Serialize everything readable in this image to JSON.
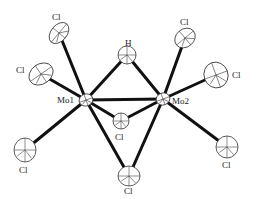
{
  "figure": {
    "type": "ORTEP molecular structure",
    "background": "#ffffff",
    "bond_color": "#111111",
    "ellipse_stroke": "#333333"
  },
  "atoms": [
    {
      "id": "Mo1",
      "label": "Mo1",
      "x": 86,
      "y": 100,
      "rx": 7,
      "ry": 6,
      "rot": -20,
      "lx": 57,
      "ly": 103
    },
    {
      "id": "Mo2",
      "label": "Mo2",
      "x": 163,
      "y": 99,
      "rx": 7,
      "ry": 6,
      "rot": -20,
      "lx": 172,
      "ly": 104
    },
    {
      "id": "H",
      "label": "H",
      "x": 127,
      "y": 55,
      "rx": 9,
      "ry": 9,
      "rot": 0,
      "lx": 125,
      "ly": 46
    },
    {
      "id": "Cl1",
      "label": "Cl",
      "x": 59,
      "y": 33,
      "rx": 12,
      "ry": 8,
      "rot": -50,
      "lx": 52,
      "ly": 20
    },
    {
      "id": "Cl2",
      "label": "Cl",
      "x": 41,
      "y": 74,
      "rx": 13,
      "ry": 10,
      "rot": -35,
      "lx": 16,
      "ly": 73
    },
    {
      "id": "Cl3",
      "label": "Cl",
      "x": 25,
      "y": 150,
      "rx": 11,
      "ry": 12,
      "rot": 0,
      "lx": 19,
      "ly": 173
    },
    {
      "id": "Cl4",
      "label": "Cl",
      "x": 121,
      "y": 121,
      "rx": 8,
      "ry": 8,
      "rot": 0,
      "lx": 115,
      "ly": 140
    },
    {
      "id": "Cl5",
      "label": "Cl",
      "x": 129,
      "y": 176,
      "rx": 11,
      "ry": 10,
      "rot": 0,
      "lx": 124,
      "ly": 194
    },
    {
      "id": "Cl6",
      "label": "Cl",
      "x": 185,
      "y": 38,
      "rx": 11,
      "ry": 9,
      "rot": -40,
      "lx": 180,
      "ly": 25
    },
    {
      "id": "Cl7",
      "label": "Cl",
      "x": 216,
      "y": 75,
      "rx": 12,
      "ry": 13,
      "rot": -20,
      "lx": 232,
      "ly": 78
    },
    {
      "id": "Cl8",
      "label": "Cl",
      "x": 227,
      "y": 147,
      "rx": 11,
      "ry": 11,
      "rot": 0,
      "lx": 222,
      "ly": 168
    }
  ],
  "bonds": [
    {
      "from": "Mo1",
      "to": "Mo2"
    },
    {
      "from": "Mo1",
      "to": "H"
    },
    {
      "from": "Mo2",
      "to": "H"
    },
    {
      "from": "Mo1",
      "to": "Cl1"
    },
    {
      "from": "Mo1",
      "to": "Cl2"
    },
    {
      "from": "Mo1",
      "to": "Cl3"
    },
    {
      "from": "Mo1",
      "to": "Cl4"
    },
    {
      "from": "Mo2",
      "to": "Cl4"
    },
    {
      "from": "Mo1",
      "to": "Cl5"
    },
    {
      "from": "Mo2",
      "to": "Cl5"
    },
    {
      "from": "Mo2",
      "to": "Cl6"
    },
    {
      "from": "Mo2",
      "to": "Cl7"
    },
    {
      "from": "Mo2",
      "to": "Cl8"
    }
  ]
}
